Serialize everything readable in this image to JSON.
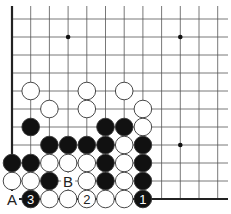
{
  "diagram": {
    "type": "go-board-corner",
    "grid": {
      "columns_x": [
        12,
        30.7,
        49.4,
        68.1,
        86.8,
        105.5,
        124.2,
        142.9,
        161.6,
        180.3,
        199,
        217.7
      ],
      "rows_y": [
        19,
        37,
        55,
        73,
        91,
        109,
        127,
        145,
        163,
        181,
        199
      ],
      "top": 6,
      "right": 228,
      "line_color": "#555555",
      "edge_color": "#222222"
    },
    "star_points": [
      [
        3,
        1
      ],
      [
        9,
        1
      ],
      [
        9,
        7
      ]
    ],
    "stones": [
      {
        "c": 1,
        "r": 4,
        "color": "white"
      },
      {
        "c": 4,
        "r": 4,
        "color": "white"
      },
      {
        "c": 6,
        "r": 4,
        "color": "white"
      },
      {
        "c": 2,
        "r": 5,
        "color": "white"
      },
      {
        "c": 4,
        "r": 5,
        "color": "white"
      },
      {
        "c": 7,
        "r": 5,
        "color": "white"
      },
      {
        "c": 1,
        "r": 6,
        "color": "black"
      },
      {
        "c": 5,
        "r": 6,
        "color": "black"
      },
      {
        "c": 6,
        "r": 6,
        "color": "black"
      },
      {
        "c": 7,
        "r": 6,
        "color": "white"
      },
      {
        "c": 2,
        "r": 7,
        "color": "black"
      },
      {
        "c": 3,
        "r": 7,
        "color": "black"
      },
      {
        "c": 4,
        "r": 7,
        "color": "black"
      },
      {
        "c": 5,
        "r": 7,
        "color": "black"
      },
      {
        "c": 6,
        "r": 7,
        "color": "white"
      },
      {
        "c": 7,
        "r": 7,
        "color": "black"
      },
      {
        "c": 0,
        "r": 8,
        "color": "black"
      },
      {
        "c": 1,
        "r": 8,
        "color": "black"
      },
      {
        "c": 2,
        "r": 8,
        "color": "white"
      },
      {
        "c": 3,
        "r": 8,
        "color": "white"
      },
      {
        "c": 4,
        "r": 8,
        "color": "white"
      },
      {
        "c": 5,
        "r": 8,
        "color": "black"
      },
      {
        "c": 6,
        "r": 8,
        "color": "white"
      },
      {
        "c": 7,
        "r": 8,
        "color": "black"
      },
      {
        "c": 0,
        "r": 9,
        "color": "white"
      },
      {
        "c": 1,
        "r": 9,
        "color": "white"
      },
      {
        "c": 2,
        "r": 9,
        "color": "black"
      },
      {
        "c": 4,
        "r": 9,
        "color": "white"
      },
      {
        "c": 5,
        "r": 9,
        "color": "black"
      },
      {
        "c": 6,
        "r": 9,
        "color": "white"
      },
      {
        "c": 7,
        "r": 9,
        "color": "black"
      },
      {
        "c": 1,
        "r": 10,
        "color": "black",
        "label": "3"
      },
      {
        "c": 2,
        "r": 10,
        "color": "white"
      },
      {
        "c": 3,
        "r": 10,
        "color": "white"
      },
      {
        "c": 4,
        "r": 10,
        "color": "white",
        "label": "2"
      },
      {
        "c": 5,
        "r": 10,
        "color": "white"
      },
      {
        "c": 6,
        "r": 10,
        "color": "white"
      },
      {
        "c": 7,
        "r": 10,
        "color": "black",
        "label": "1"
      }
    ],
    "letter_marks": [
      {
        "c": 0,
        "r": 10,
        "label": "A"
      },
      {
        "c": 3,
        "r": 9,
        "label": "B"
      }
    ],
    "colors": {
      "black_stone": "#111111",
      "white_stone": "#ffffff",
      "stone_outline": "#333333"
    }
  }
}
